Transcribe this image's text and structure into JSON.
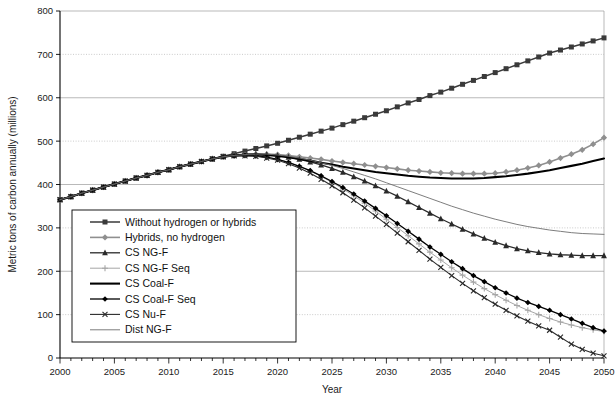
{
  "chart_data": {
    "type": "line",
    "title": "",
    "xlabel": "Year",
    "ylabel": "Metric tons of carbon annually (millions)",
    "xlim": [
      2000,
      2050
    ],
    "ylim": [
      0,
      800
    ],
    "xticks": [
      2000,
      2005,
      2010,
      2015,
      2020,
      2025,
      2030,
      2035,
      2040,
      2045,
      2050
    ],
    "xtick_labels": [
      "2000",
      "2005",
      "2010",
      "2015",
      "2020",
      "2025",
      "2030",
      "2035",
      "2040",
      "2045",
      "2050"
    ],
    "yticks": [
      0,
      100,
      200,
      300,
      400,
      500,
      600,
      700,
      800
    ],
    "ytick_labels": [
      "0",
      "100",
      "200",
      "300",
      "400",
      "500",
      "600",
      "700",
      "800"
    ],
    "x_minor_tick_interval": 1,
    "grid": "horizontal",
    "legend_position": "lower-left-inside",
    "x": [
      2000,
      2001,
      2002,
      2003,
      2004,
      2005,
      2006,
      2007,
      2008,
      2009,
      2010,
      2011,
      2012,
      2013,
      2014,
      2015,
      2016,
      2017,
      2018,
      2019,
      2020,
      2021,
      2022,
      2023,
      2024,
      2025,
      2026,
      2027,
      2028,
      2029,
      2030,
      2031,
      2032,
      2033,
      2034,
      2035,
      2036,
      2037,
      2038,
      2039,
      2040,
      2041,
      2042,
      2043,
      2044,
      2045,
      2046,
      2047,
      2048,
      2049,
      2050
    ],
    "series": [
      {
        "name": "Without hydrogen or hybrids",
        "marker": "square",
        "color": "#3a3a3a",
        "line_width": 1.5,
        "values": [
          365,
          372,
          380,
          387,
          394,
          401,
          408,
          415,
          421,
          428,
          434,
          441,
          447,
          453,
          459,
          465,
          471,
          477,
          483,
          489,
          495,
          502,
          509,
          516,
          523,
          530,
          538,
          546,
          554,
          562,
          570,
          579,
          588,
          596,
          605,
          613,
          622,
          631,
          640,
          649,
          658,
          667,
          676,
          685,
          694,
          703,
          710,
          717,
          724,
          731,
          738
        ]
      },
      {
        "name": "Hybrids, no hydrogen",
        "marker": "diamond",
        "color": "#8f8f8f",
        "line_width": 1.6,
        "values": [
          365,
          372,
          380,
          387,
          394,
          401,
          408,
          415,
          421,
          428,
          434,
          441,
          447,
          453,
          459,
          464,
          467,
          469,
          470,
          470,
          469,
          467,
          464,
          461,
          458,
          454,
          451,
          448,
          445,
          442,
          439,
          436,
          433,
          431,
          429,
          427,
          426,
          425,
          425,
          425,
          426,
          429,
          433,
          438,
          444,
          452,
          461,
          470,
          480,
          493,
          508
        ]
      },
      {
        "name": "CS NG-F",
        "marker": "triangle",
        "color": "#2a2a2a",
        "line_width": 1.3,
        "values": [
          365,
          372,
          380,
          387,
          394,
          401,
          408,
          415,
          421,
          428,
          434,
          441,
          447,
          453,
          459,
          464,
          467,
          469,
          470,
          469,
          467,
          463,
          458,
          452,
          445,
          437,
          428,
          418,
          408,
          397,
          385,
          373,
          360,
          347,
          334,
          321,
          309,
          297,
          286,
          276,
          267,
          259,
          252,
          247,
          243,
          240,
          238,
          237,
          236,
          236,
          236
        ]
      },
      {
        "name": "CS NG-F Seq",
        "marker": "plus",
        "color": "#a6a6a6",
        "line_width": 1.0,
        "values": [
          365,
          372,
          380,
          387,
          394,
          401,
          408,
          415,
          421,
          428,
          434,
          441,
          447,
          453,
          459,
          464,
          466,
          467,
          466,
          463,
          458,
          451,
          442,
          431,
          419,
          405,
          390,
          374,
          357,
          339,
          320,
          301,
          282,
          263,
          244,
          226,
          208,
          191,
          175,
          160,
          146,
          133,
          121,
          110,
          100,
          91,
          83,
          76,
          70,
          65,
          61
        ]
      },
      {
        "name": "CS Coal-F",
        "marker": "none",
        "color": "#000000",
        "line_width": 2.1,
        "values": [
          365,
          372,
          380,
          387,
          394,
          401,
          408,
          415,
          421,
          428,
          434,
          441,
          447,
          453,
          459,
          464,
          467,
          469,
          469,
          468,
          466,
          463,
          459,
          455,
          450,
          446,
          441,
          437,
          433,
          429,
          426,
          423,
          420,
          418,
          416,
          415,
          414,
          414,
          414,
          415,
          417,
          419,
          422,
          425,
          429,
          433,
          438,
          443,
          448,
          454,
          460
        ]
      },
      {
        "name": "CS Coal-F Seq",
        "marker": "filled-diamond",
        "color": "#000000",
        "line_width": 1.3,
        "values": [
          365,
          372,
          380,
          387,
          394,
          401,
          408,
          415,
          421,
          428,
          434,
          441,
          447,
          453,
          459,
          464,
          466,
          467,
          466,
          463,
          458,
          451,
          442,
          432,
          420,
          407,
          393,
          378,
          362,
          345,
          328,
          310,
          292,
          274,
          256,
          239,
          222,
          206,
          190,
          176,
          162,
          150,
          138,
          128,
          119,
          110,
          100,
          90,
          80,
          70,
          62
        ]
      },
      {
        "name": "CS Nu-F",
        "marker": "x",
        "color": "#2a2a2a",
        "line_width": 1.1,
        "values": [
          365,
          372,
          380,
          387,
          394,
          401,
          408,
          415,
          421,
          428,
          434,
          441,
          447,
          453,
          459,
          464,
          466,
          466,
          465,
          461,
          456,
          448,
          438,
          426,
          412,
          397,
          381,
          364,
          346,
          327,
          308,
          288,
          268,
          248,
          228,
          209,
          190,
          172,
          155,
          139,
          124,
          110,
          97,
          85,
          74,
          64,
          48,
          32,
          20,
          11,
          5
        ]
      },
      {
        "name": "Dist NG-F",
        "marker": "none",
        "color": "#6e6e6e",
        "line_width": 0.9,
        "values": [
          365,
          372,
          380,
          387,
          394,
          401,
          408,
          415,
          421,
          428,
          434,
          441,
          447,
          453,
          459,
          464,
          467,
          469,
          470,
          470,
          468,
          465,
          461,
          456,
          450,
          444,
          437,
          429,
          421,
          413,
          404,
          395,
          386,
          377,
          368,
          359,
          350,
          342,
          334,
          327,
          320,
          314,
          308,
          303,
          299,
          295,
          292,
          289,
          287,
          286,
          285
        ]
      }
    ]
  },
  "legend": {
    "entries": [
      {
        "label": "Without hydrogen or hybrids"
      },
      {
        "label": "Hybrids, no hydrogen"
      },
      {
        "label": "CS NG-F"
      },
      {
        "label": "CS NG-F Seq"
      },
      {
        "label": "CS Coal-F"
      },
      {
        "label": "CS Coal-F Seq"
      },
      {
        "label": "CS Nu-F"
      },
      {
        "label": "Dist NG-F"
      }
    ]
  },
  "caption": {
    "text": ""
  }
}
